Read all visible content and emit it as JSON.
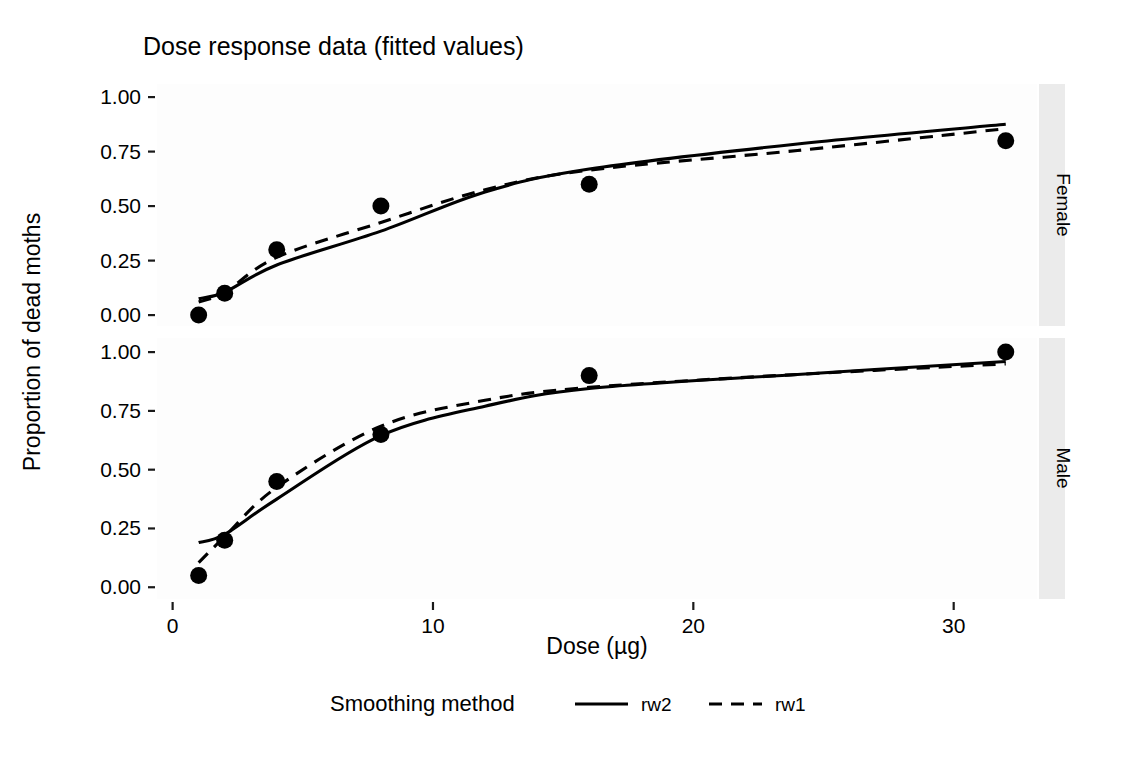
{
  "chart_data": {
    "type": "line",
    "title": "Dose response data (fitted values)",
    "xlabel": "Dose (µg)",
    "ylabel": "Proportion of dead moths",
    "xlim": [
      -0.6,
      33.2
    ],
    "ylim": [
      -0.05,
      1.06
    ],
    "x_ticks": [
      0,
      10,
      20,
      30
    ],
    "x_tick_labels": [
      "0",
      "10",
      "20",
      "30"
    ],
    "y_ticks": [
      0.0,
      0.25,
      0.5,
      0.75,
      1.0
    ],
    "y_tick_labels": [
      "0.00",
      "0.25",
      "0.50",
      "0.75",
      "1.00"
    ],
    "grid": false,
    "legend_position": "bottom",
    "legend_title": "Smoothing method",
    "facet_variable": "sex",
    "facets": [
      {
        "name": "Female",
        "strip_label": "Female",
        "observed": {
          "name": "observed proportion",
          "marker": "filled-circle",
          "x": [
            1,
            2,
            4,
            8,
            16,
            32
          ],
          "y": [
            0.0,
            0.1,
            0.3,
            0.5,
            0.6,
            0.8
          ]
        },
        "series": [
          {
            "name": "rw2",
            "style": "solid",
            "x": [
              1,
              2,
              4,
              8,
              12,
              16,
              24,
              32
            ],
            "y": [
              0.075,
              0.105,
              0.23,
              0.385,
              0.565,
              0.67,
              0.785,
              0.875
            ]
          },
          {
            "name": "rw1",
            "style": "dashed",
            "x": [
              1,
              2,
              4,
              8,
              12,
              16,
              24,
              32
            ],
            "y": [
              0.06,
              0.105,
              0.265,
              0.425,
              0.575,
              0.665,
              0.755,
              0.855
            ]
          }
        ]
      },
      {
        "name": "Male",
        "strip_label": "Male",
        "observed": {
          "name": "observed proportion",
          "marker": "filled-circle",
          "x": [
            1,
            2,
            4,
            8,
            16,
            32
          ],
          "y": [
            0.05,
            0.2,
            0.45,
            0.65,
            0.9,
            1.0
          ]
        },
        "series": [
          {
            "name": "rw2",
            "style": "solid",
            "x": [
              1,
              2,
              4,
              8,
              12,
              16,
              24,
              32
            ],
            "y": [
              0.19,
              0.225,
              0.375,
              0.645,
              0.77,
              0.845,
              0.905,
              0.96
            ]
          },
          {
            "name": "rw1",
            "style": "dashed",
            "x": [
              1,
              2,
              4,
              8,
              12,
              16,
              24,
              32
            ],
            "y": [
              0.105,
              0.215,
              0.425,
              0.685,
              0.795,
              0.85,
              0.905,
              0.95
            ]
          }
        ]
      }
    ],
    "legend_entries": [
      {
        "label": "rw2",
        "style": "solid",
        "color": "#000000"
      },
      {
        "label": "rw1",
        "style": "dashed",
        "color": "#000000"
      }
    ],
    "colors": {
      "line": "#000000",
      "point": "#000000",
      "panel_background": "#fdfdfd",
      "strip_background": "#ebebeb",
      "text": "#000000"
    }
  }
}
